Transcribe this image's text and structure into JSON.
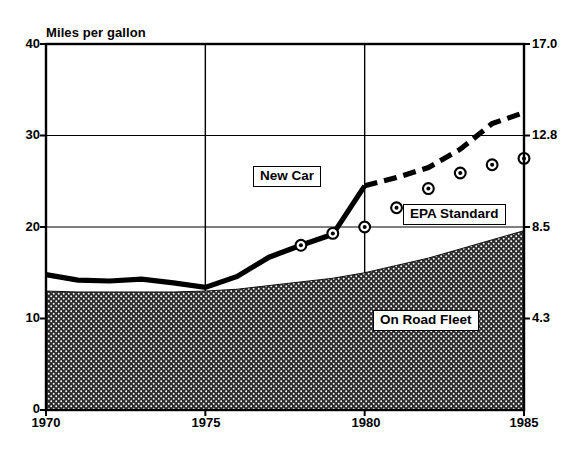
{
  "chart_data": {
    "type": "line",
    "title": "",
    "ylabel": "Miles per gallon",
    "xlabel": "",
    "xlim": [
      1970,
      1985
    ],
    "ylim": [
      0,
      40
    ],
    "grid": true,
    "x_ticks": [
      "1970",
      "1975",
      "1980",
      "1985"
    ],
    "x_tick_values": [
      1970,
      1975,
      1980,
      1985
    ],
    "y_ticks_left": [
      "0",
      "10",
      "20",
      "30",
      "40"
    ],
    "y_tick_values_left": [
      0,
      10,
      20,
      30,
      40
    ],
    "y_axis_right_label": "",
    "y_ticks_right": [
      "4.3",
      "8.5",
      "12.8",
      "17.0"
    ],
    "y_tick_values_right": [
      10,
      20,
      30,
      40
    ],
    "legend_position": "inline-callouts",
    "annotations": [
      {
        "name": "New Car",
        "x": 1977.1,
        "y": 25.3
      },
      {
        "name": "EPA Standard",
        "x": 1981.9,
        "y": 20.6
      },
      {
        "name": "On Road Fleet",
        "x": 1981.1,
        "y": 9.8
      }
    ],
    "series": [
      {
        "name": "New Car",
        "style": "solid-thick",
        "x": [
          1970,
          1971,
          1972,
          1973,
          1974,
          1975,
          1976,
          1977,
          1978,
          1979,
          1980
        ],
        "values": [
          14.8,
          14.2,
          14.1,
          14.3,
          13.9,
          13.4,
          14.6,
          16.7,
          18.0,
          19.2,
          24.5
        ]
      },
      {
        "name": "EPA Standard",
        "style": "dashed-thick",
        "x": [
          1980,
          1981,
          1982,
          1983,
          1984,
          1985
        ],
        "values": [
          24.5,
          25.4,
          26.5,
          28.5,
          31.3,
          32.5
        ]
      },
      {
        "name": "On Road Fleet",
        "style": "filled-area-hatched",
        "x": [
          1970,
          1971,
          1972,
          1973,
          1974,
          1975,
          1976,
          1977,
          1978,
          1979,
          1980,
          1981,
          1982,
          1983,
          1984,
          1985
        ],
        "values": [
          13.0,
          12.9,
          12.9,
          12.9,
          12.9,
          13.0,
          13.2,
          13.6,
          14.0,
          14.4,
          15.0,
          15.8,
          16.6,
          17.6,
          18.6,
          19.6
        ]
      },
      {
        "name": "New Car Actual (markers)",
        "style": "markers",
        "x": [
          1978,
          1979,
          1980,
          1981,
          1982,
          1983,
          1984,
          1985
        ],
        "values": [
          18.0,
          19.3,
          20.0,
          22.1,
          24.2,
          25.9,
          26.8,
          27.5
        ]
      }
    ],
    "colors": {
      "line": "#000000",
      "area_fill": "#2a2a2a",
      "frame": "#000000",
      "background": "#ffffff"
    }
  }
}
